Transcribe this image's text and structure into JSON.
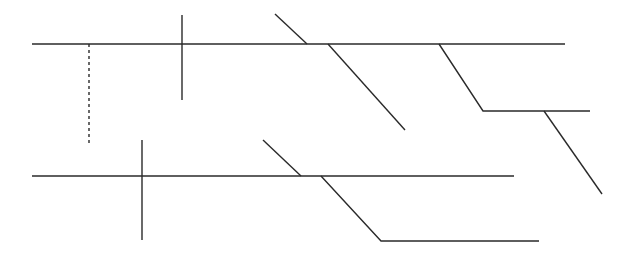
{
  "diagram": {
    "type": "line-diagram",
    "width": 628,
    "height": 255,
    "background": "#ffffff",
    "stroke_color": "#2a2a2a",
    "stroke_width": 1.4,
    "groups": [
      {
        "name": "upper-structure",
        "segments": [
          {
            "name": "upper-main-line",
            "points": [
              [
                32,
                44
              ],
              [
                565,
                44
              ]
            ],
            "dashed": false
          },
          {
            "name": "upper-dashed-drop",
            "points": [
              [
                89,
                44
              ],
              [
                89,
                146
              ]
            ],
            "dashed": true
          },
          {
            "name": "upper-vertical-cross",
            "points": [
              [
                182,
                15
              ],
              [
                182,
                100
              ]
            ],
            "dashed": false
          },
          {
            "name": "upper-short-diagonal",
            "points": [
              [
                275,
                14
              ],
              [
                307,
                44
              ]
            ],
            "dashed": false
          },
          {
            "name": "upper-long-diagonal",
            "points": [
              [
                328,
                44
              ],
              [
                405,
                130
              ]
            ],
            "dashed": false
          },
          {
            "name": "upper-branch-offset",
            "points": [
              [
                439,
                44
              ],
              [
                483,
                111
              ],
              [
                590,
                111
              ]
            ],
            "dashed": false
          },
          {
            "name": "upper-branch-tail-diagonal",
            "points": [
              [
                544,
                111
              ],
              [
                602,
                194
              ]
            ],
            "dashed": false
          }
        ]
      },
      {
        "name": "lower-structure",
        "segments": [
          {
            "name": "lower-main-line",
            "points": [
              [
                32,
                176
              ],
              [
                514,
                176
              ]
            ],
            "dashed": false
          },
          {
            "name": "lower-vertical-cross",
            "points": [
              [
                142,
                140
              ],
              [
                142,
                240
              ]
            ],
            "dashed": false
          },
          {
            "name": "lower-short-diagonal",
            "points": [
              [
                263,
                140
              ],
              [
                301,
                176
              ]
            ],
            "dashed": false
          },
          {
            "name": "lower-branch-offset",
            "points": [
              [
                321,
                176
              ],
              [
                381,
                241
              ],
              [
                539,
                241
              ]
            ],
            "dashed": false
          }
        ]
      }
    ]
  }
}
